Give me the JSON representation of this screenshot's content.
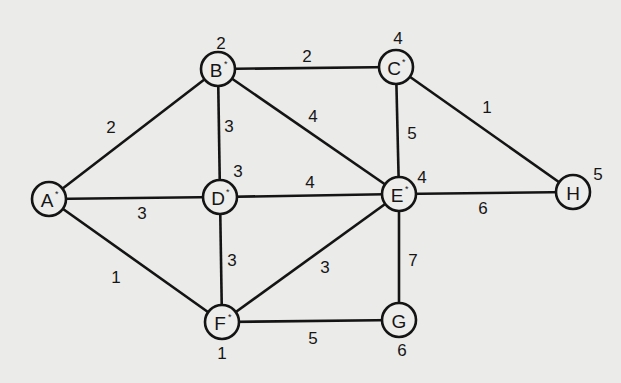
{
  "diagram": {
    "type": "weighted-undirected-graph",
    "node_radius": 17,
    "colors": {
      "background": "#ebebe9",
      "stroke": "#141414",
      "text": "#161616"
    },
    "nodes": [
      {
        "id": "A",
        "label": "A",
        "marked": true,
        "value": null,
        "x": 49,
        "y": 199,
        "value_x": null,
        "value_y": null
      },
      {
        "id": "B",
        "label": "B",
        "marked": true,
        "value": "2",
        "x": 218,
        "y": 69,
        "value_x": 221,
        "value_y": 43
      },
      {
        "id": "C",
        "label": "C",
        "marked": true,
        "value": "4",
        "x": 396,
        "y": 67,
        "value_x": 398,
        "value_y": 38
      },
      {
        "id": "D",
        "label": "D",
        "marked": true,
        "value": "3",
        "x": 220,
        "y": 197,
        "value_x": 238,
        "value_y": 171
      },
      {
        "id": "E",
        "label": "E",
        "marked": true,
        "value": "4",
        "x": 399,
        "y": 194,
        "value_x": 422,
        "value_y": 177
      },
      {
        "id": "F",
        "label": "F",
        "marked": true,
        "value": "1",
        "x": 222,
        "y": 322,
        "value_x": 222,
        "value_y": 353
      },
      {
        "id": "G",
        "label": "G",
        "marked": false,
        "value": "6",
        "x": 399,
        "y": 320,
        "value_x": 402,
        "value_y": 350
      },
      {
        "id": "H",
        "label": "H",
        "marked": false,
        "value": "5",
        "x": 573,
        "y": 192,
        "value_x": 598,
        "value_y": 174
      }
    ],
    "edges": [
      {
        "from": "A",
        "to": "B",
        "weight": "2",
        "label_x": 111,
        "label_y": 127
      },
      {
        "from": "A",
        "to": "D",
        "weight": "3",
        "label_x": 142,
        "label_y": 213
      },
      {
        "from": "A",
        "to": "F",
        "weight": "1",
        "label_x": 116,
        "label_y": 277
      },
      {
        "from": "B",
        "to": "C",
        "weight": "2",
        "label_x": 307,
        "label_y": 56
      },
      {
        "from": "B",
        "to": "D",
        "weight": "3",
        "label_x": 229,
        "label_y": 126
      },
      {
        "from": "B",
        "to": "E",
        "weight": "4",
        "label_x": 313,
        "label_y": 116
      },
      {
        "from": "C",
        "to": "E",
        "weight": "5",
        "label_x": 412,
        "label_y": 133
      },
      {
        "from": "C",
        "to": "H",
        "weight": "1",
        "label_x": 487,
        "label_y": 107
      },
      {
        "from": "D",
        "to": "E",
        "weight": "4",
        "label_x": 310,
        "label_y": 182
      },
      {
        "from": "D",
        "to": "F",
        "weight": "3",
        "label_x": 232,
        "label_y": 260
      },
      {
        "from": "E",
        "to": "F",
        "weight": "3",
        "label_x": 325,
        "label_y": 267
      },
      {
        "from": "E",
        "to": "G",
        "weight": "7",
        "label_x": 413,
        "label_y": 260
      },
      {
        "from": "E",
        "to": "H",
        "weight": "6",
        "label_x": 483,
        "label_y": 208
      },
      {
        "from": "F",
        "to": "G",
        "weight": "5",
        "label_x": 313,
        "label_y": 338
      }
    ]
  }
}
